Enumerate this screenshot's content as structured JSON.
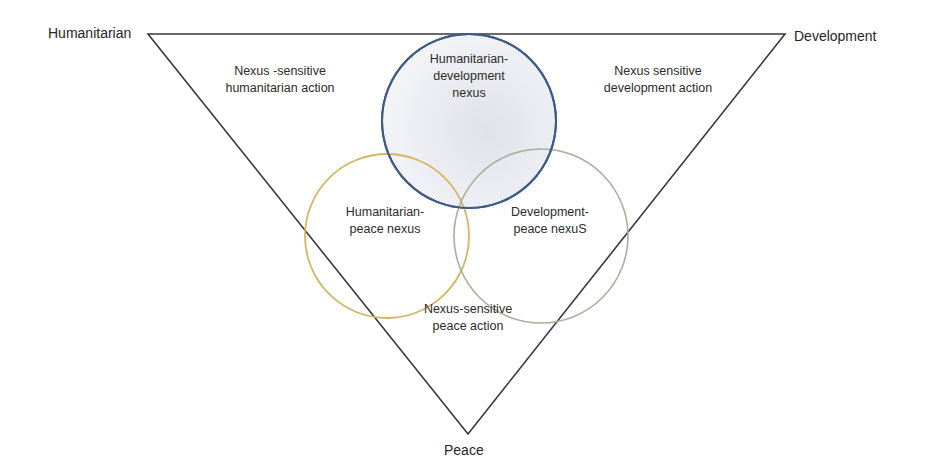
{
  "diagram": {
    "type": "triple-nexus-venn-triangle",
    "vertices": {
      "top_left": "Humanitarian",
      "top_right": "Development",
      "bottom": "Peace"
    },
    "regions": {
      "humanitarian_action": {
        "line1": "Nexus -sensitive",
        "line2": "humanitarian action"
      },
      "development_action": {
        "line1": "Nexus sensitive",
        "line2": "development action"
      },
      "peace_action": {
        "line1": "Nexus-sensitive",
        "line2": "peace action"
      }
    },
    "circles": [
      {
        "id": "humanitarian-development",
        "line1": "Humanitarian-",
        "line2": "development",
        "line3": "nexus",
        "stroke": "#3f5a86",
        "fill": "#eceef3"
      },
      {
        "id": "humanitarian-peace",
        "line1": "Humanitarian-",
        "line2": "peace nexus",
        "stroke": "#d4b760"
      },
      {
        "id": "development-peace",
        "line1": "Development-",
        "line2": "peace nexuS",
        "stroke": "#a7b09c"
      }
    ],
    "colors": {
      "triangle_stroke": "#3a3a3a",
      "text": "#2b2b2b",
      "background": "#ffffff"
    }
  }
}
